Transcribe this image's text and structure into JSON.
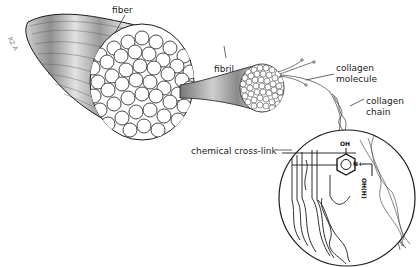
{
  "diagram": {
    "labels": {
      "fiber": "fiber",
      "fibril": "fibril",
      "collagen_molecule_line1": "collagen",
      "collagen_molecule_line2": "molecule",
      "collagen_chain_line1": "collagen",
      "collagen_chain_line2": "chain",
      "chemical_cross_link": "chemical cross-link"
    },
    "chem": {
      "oh": "OH",
      "n_plus": "N+",
      "ohh": "OH(H)"
    },
    "signature": "RZ.A",
    "colors": {
      "stroke": "#1a1a1a",
      "fiber_dark": "#8a8a8a",
      "fiber_light": "#d8d8d8",
      "background": "#ffffff"
    }
  }
}
